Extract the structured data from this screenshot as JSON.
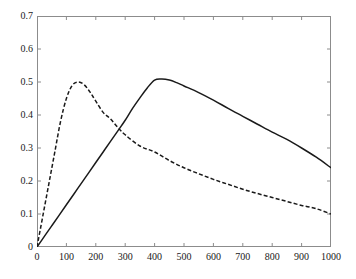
{
  "chart_data": {
    "type": "line",
    "title": "",
    "xlabel": "",
    "ylabel": "",
    "xlim": [
      0,
      1000
    ],
    "ylim": [
      0,
      0.7
    ],
    "grid": false,
    "legend": "none",
    "xticks": [
      "0",
      "100",
      "200",
      "300",
      "400",
      "500",
      "600",
      "700",
      "800",
      "900",
      "1000"
    ],
    "xtick_values": [
      0,
      100,
      200,
      300,
      400,
      500,
      600,
      700,
      800,
      900,
      1000
    ],
    "yticks": [
      "0",
      "0.1",
      "0.2",
      "0.3",
      "0.4",
      "0.5",
      "0.6",
      "0.7"
    ],
    "ytick_values": [
      0,
      0.1,
      0.2,
      0.3,
      0.4,
      0.5,
      0.6,
      0.7
    ],
    "series": [
      {
        "name": "solid-curve",
        "style": "solid",
        "color": "#1a1a1a",
        "x": [
          0,
          25,
          50,
          75,
          100,
          125,
          150,
          175,
          200,
          225,
          250,
          275,
          300,
          325,
          350,
          375,
          400,
          425,
          450,
          475,
          500,
          550,
          600,
          650,
          700,
          750,
          800,
          850,
          900,
          950,
          1000
        ],
        "values": [
          0.0,
          0.032,
          0.064,
          0.096,
          0.128,
          0.16,
          0.192,
          0.224,
          0.256,
          0.288,
          0.32,
          0.352,
          0.384,
          0.42,
          0.452,
          0.482,
          0.506,
          0.509,
          0.506,
          0.498,
          0.488,
          0.468,
          0.445,
          0.42,
          0.396,
          0.372,
          0.348,
          0.326,
          0.3,
          0.272,
          0.24
        ]
      },
      {
        "name": "dashed-curve",
        "style": "dashed",
        "color": "#1a1a1a",
        "x": [
          0,
          20,
          40,
          60,
          80,
          100,
          120,
          140,
          160,
          180,
          200,
          225,
          250,
          275,
          300,
          350,
          400,
          450,
          500,
          550,
          600,
          650,
          700,
          750,
          800,
          850,
          900,
          950,
          1000
        ],
        "values": [
          0.0,
          0.095,
          0.19,
          0.285,
          0.38,
          0.45,
          0.49,
          0.5,
          0.492,
          0.47,
          0.442,
          0.408,
          0.388,
          0.362,
          0.34,
          0.306,
          0.288,
          0.262,
          0.24,
          0.222,
          0.205,
          0.19,
          0.175,
          0.162,
          0.15,
          0.138,
          0.126,
          0.116,
          0.1
        ]
      }
    ]
  }
}
